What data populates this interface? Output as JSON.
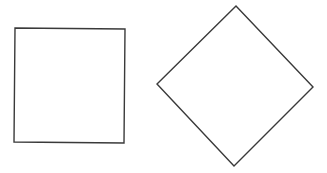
{
  "diagram": {
    "shapes": [
      {
        "id": "square",
        "kind": "square",
        "rotation_deg": 0,
        "fill": "#ffffff",
        "stroke": "#3a3a3a"
      },
      {
        "id": "diamond",
        "kind": "square",
        "rotation_deg": 45,
        "fill": "#ffffff",
        "stroke": "#3a3a3a"
      }
    ]
  }
}
